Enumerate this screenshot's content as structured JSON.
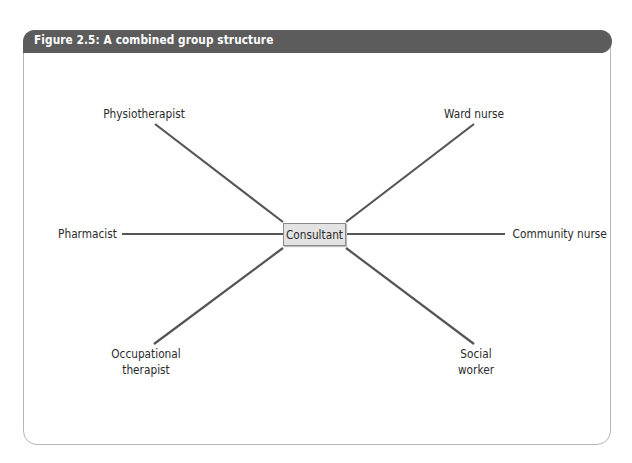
{
  "figure": {
    "title": "Figure 2.5: A combined group structure"
  },
  "diagram": {
    "type": "hub-and-spoke",
    "center": "Consultant",
    "nodes": [
      {
        "id": "physiotherapist",
        "label": "Physiotherapist",
        "position": "top-left"
      },
      {
        "id": "ward-nurse",
        "label": "Ward nurse",
        "position": "top-right"
      },
      {
        "id": "pharmacist",
        "label": "Pharmacist",
        "position": "left"
      },
      {
        "id": "community-nurse",
        "label": "Community nurse",
        "position": "right"
      },
      {
        "id": "occupational-therapist",
        "label_line1": "Occupational",
        "label_line2": "therapist",
        "position": "bottom-left"
      },
      {
        "id": "social-worker",
        "label_line1": "Social",
        "label_line2": "worker",
        "position": "bottom-right"
      }
    ],
    "edge_color": "#555555",
    "header_color": "#5c5c5c"
  }
}
